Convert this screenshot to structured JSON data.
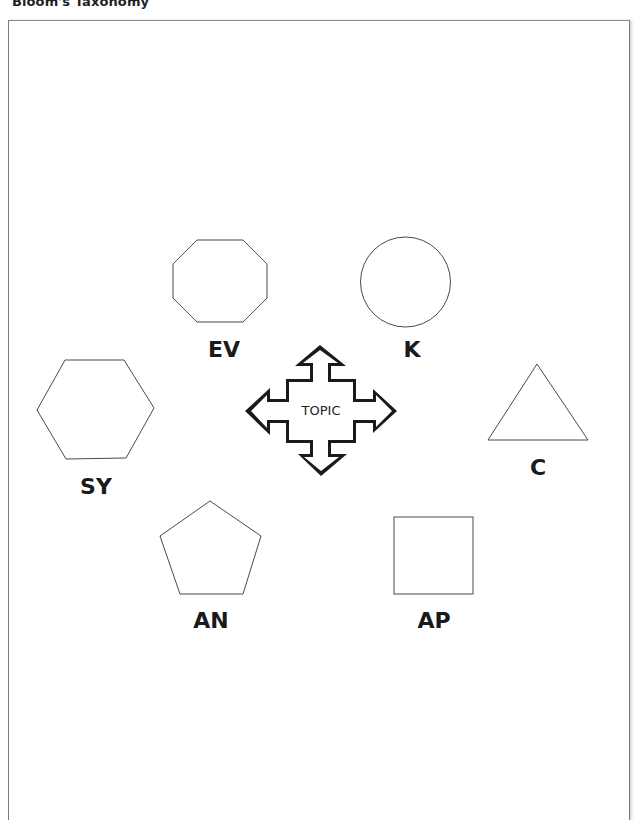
{
  "page": {
    "title": "Bloom's Taxonomy"
  },
  "center": {
    "label": "TOPIC",
    "icon": "four-way-arrow-icon"
  },
  "nodes": [
    {
      "id": "evaluation",
      "label": "EV",
      "shape": "octagon"
    },
    {
      "id": "knowledge",
      "label": "K",
      "shape": "circle"
    },
    {
      "id": "synthesis",
      "label": "SY",
      "shape": "hexagon"
    },
    {
      "id": "comprehension",
      "label": "C",
      "shape": "triangle"
    },
    {
      "id": "analysis",
      "label": "AN",
      "shape": "pentagon"
    },
    {
      "id": "application",
      "label": "AP",
      "shape": "square"
    }
  ],
  "colors": {
    "stroke": "#4a4a4a",
    "arrow": "#1a1a1a",
    "background": "#ffffff"
  }
}
